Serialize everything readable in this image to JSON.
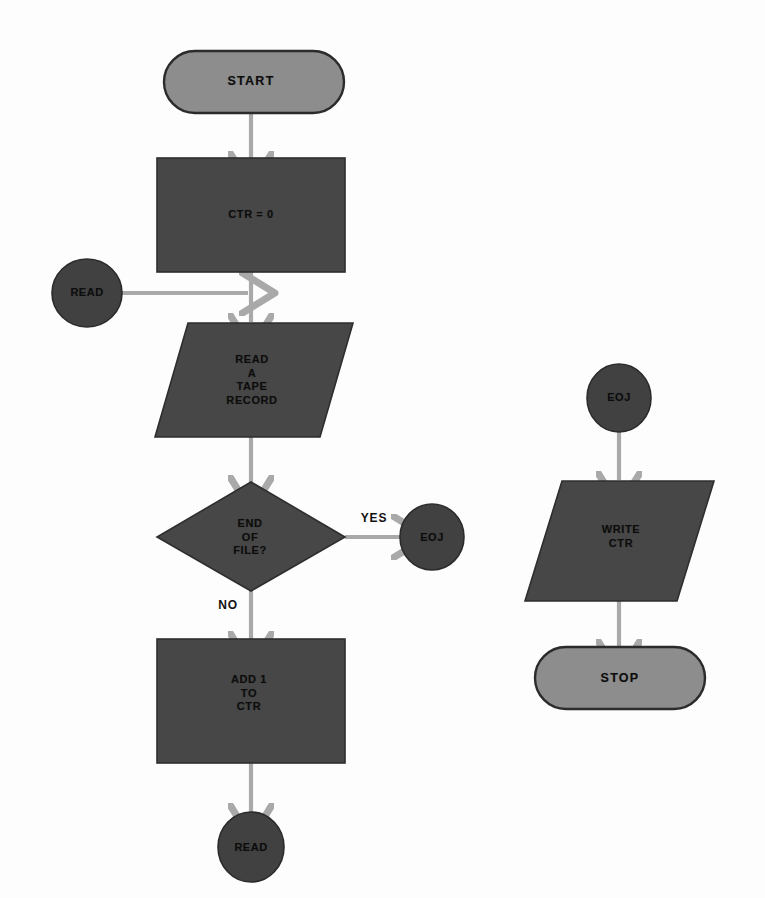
{
  "diagram": {
    "background_color": "#fdfdfd",
    "colors": {
      "terminator_fill": "#8d8d8d",
      "process_fill": "#474747",
      "connector_fill": "#414141",
      "arrow": "#a9a9a9",
      "outline": "#2b2b2b",
      "text": "#0d0d0d"
    }
  },
  "nodes": {
    "start": {
      "label": "START",
      "shape": "terminator"
    },
    "init_counter": {
      "label": "CTR = 0",
      "shape": "process"
    },
    "read_connector_in": {
      "label": "READ",
      "shape": "connector"
    },
    "read_record": {
      "label": "READ\nA\nTAPE\nRECORD",
      "shape": "input-output"
    },
    "end_of_file": {
      "label": "END\nOF\nFILE?",
      "shape": "decision"
    },
    "eoj_connector_out": {
      "label": "EOJ",
      "shape": "connector"
    },
    "add_counter": {
      "label": "ADD 1\nTO\nCTR",
      "shape": "process"
    },
    "read_connector_out": {
      "label": "READ",
      "shape": "connector"
    },
    "eoj_connector_in": {
      "label": "EOJ",
      "shape": "connector"
    },
    "write_counter": {
      "label": "WRITE\nCTR",
      "shape": "input-output"
    },
    "stop": {
      "label": "STOP",
      "shape": "terminator"
    }
  },
  "edge_labels": {
    "yes": "YES",
    "no": "NO"
  }
}
